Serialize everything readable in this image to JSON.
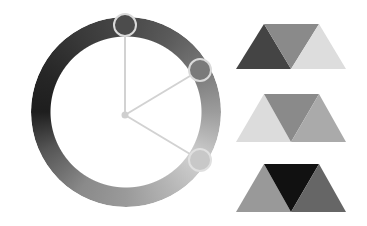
{
  "wheel": {
    "center": {
      "x": 126,
      "y": 115
    },
    "outer_radius": 95,
    "inner_radius": 75,
    "spoke_color": "#d0d0d0",
    "handles": [
      {
        "name": "handle-1",
        "x": 125,
        "y": 25,
        "fill": "#4c4c4c"
      },
      {
        "name": "handle-2",
        "x": 200,
        "y": 70,
        "fill": "#7a7a7a"
      },
      {
        "name": "handle-3",
        "x": 200,
        "y": 160,
        "fill": "#c8c8c8"
      }
    ]
  },
  "swatches": [
    {
      "name": "swatch-group-1",
      "colors": [
        "#444444",
        "#8a8a8a",
        "#dddddd"
      ]
    },
    {
      "name": "swatch-group-2",
      "colors": [
        "#dcdcdc",
        "#8a8a8a",
        "#aaaaaa"
      ]
    },
    {
      "name": "swatch-group-3",
      "colors": [
        "#999999",
        "#111111",
        "#666666"
      ]
    }
  ]
}
